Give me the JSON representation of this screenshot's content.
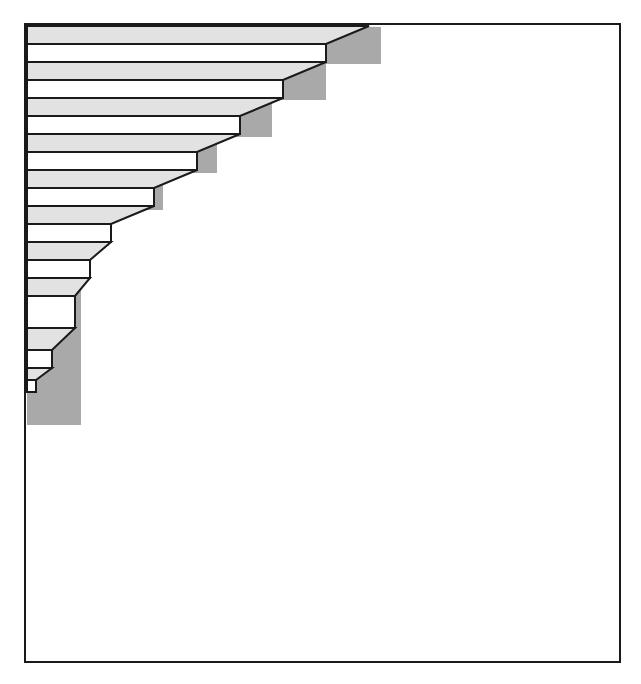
{
  "figure": {
    "type": "line-drawing",
    "background_color": "#FFFFFF"
  },
  "frame": {
    "name": "outer-border",
    "x": 25,
    "y": 24,
    "width": 595,
    "height": 638,
    "stroke_color": "#1A1A1A",
    "stroke_width": 2,
    "fill_color": "#FFFFFF"
  },
  "palette": {
    "outline": "#1A1A1A",
    "tread_light_gray": "#E2E2E2",
    "riser_white": "#FFFFFF",
    "side_wall_gray": "#A9A9A9",
    "background": "#FFFFFF"
  },
  "geometry": {
    "step_count": 10,
    "step_rise_px": 36,
    "tread_band_px": 18,
    "riser_band_px": 18,
    "run_offset_px": 43,
    "depth_dx_px": 55,
    "depth_dy_px": 18,
    "left_edge_x": 27,
    "top_edge_y": 26,
    "apex_x": 418,
    "apex_y": 27,
    "bottom_y": 425
  },
  "staircase": {
    "name": "staircase-solid",
    "side_wall_points": "27,26 418,27 381,27 381,64 326,64 326,100 272,100 272,137 217,137 217,173 163,173 163,210 109,210 109,246 81,246 81,283 81,319 81,355 81,389 81,425 27,425",
    "steps": [
      {
        "index": 1,
        "tread_points": "27,26 369,26 326,44 27,44",
        "riser_points": "27,44 326,44 326,62 27,62",
        "front_right_x": 326,
        "tread_top_y": 26,
        "tread_bottom_y": 44,
        "riser_bottom_y": 62
      },
      {
        "index": 2,
        "tread_points": "27,62 326,62 283,80 27,80",
        "riser_points": "27,80 283,80 283,98 27,98",
        "front_right_x": 283,
        "tread_top_y": 62,
        "tread_bottom_y": 80,
        "riser_bottom_y": 98
      },
      {
        "index": 3,
        "tread_points": "27,98 283,98 240,116 27,116",
        "riser_points": "27,116 240,116 240,134 27,134",
        "front_right_x": 240,
        "tread_top_y": 98,
        "tread_bottom_y": 116,
        "riser_bottom_y": 134
      },
      {
        "index": 4,
        "tread_points": "27,134 240,134 197,152 27,152",
        "riser_points": "27,152 197,152 197,170 27,170",
        "front_right_x": 197,
        "tread_top_y": 134,
        "tread_bottom_y": 152,
        "riser_bottom_y": 170
      },
      {
        "index": 5,
        "tread_points": "27,170 197,170 154,188 27,188",
        "riser_points": "27,188 154,188 154,206 27,206",
        "front_right_x": 154,
        "tread_top_y": 170,
        "tread_bottom_y": 188,
        "riser_bottom_y": 206
      },
      {
        "index": 6,
        "tread_points": "27,206 154,206 111,224 27,224",
        "riser_points": "27,224 111,224 111,242 27,242",
        "front_right_x": 111,
        "tread_top_y": 206,
        "tread_bottom_y": 224,
        "riser_bottom_y": 242
      },
      {
        "index": 7,
        "tread_points": "27,242 111,242 90,260 27,260",
        "riser_points": "27,260 90,260 90,278 27,278",
        "front_right_x": 90,
        "tread_top_y": 242,
        "tread_bottom_y": 260,
        "riser_bottom_y": 278
      },
      {
        "index": 8,
        "tread_points": "27,278 90,278 75,296 27,296",
        "riser_points": "27,296 75,296 75,328 27,328",
        "front_right_x": 75,
        "tread_top_y": 278,
        "tread_bottom_y": 296,
        "riser_bottom_y": 328
      },
      {
        "index": 9,
        "tread_points": "27,328 75,328 52,350 27,350",
        "riser_points": "27,350 52,350 52,368 27,368",
        "front_right_x": 52,
        "tread_top_y": 328,
        "tread_bottom_y": 350,
        "riser_bottom_y": 368
      },
      {
        "index": 10,
        "tread_points": "27,368 52,368 36,380 27,380",
        "riser_points": "27,380 36,380 36,392 27,392",
        "front_right_x": 36,
        "tread_top_y": 368,
        "tread_bottom_y": 380,
        "riser_bottom_y": 392
      }
    ]
  },
  "chart_data": {
    "type": "line",
    "xlabel": "Step index (top to bottom)",
    "ylabel": "Front edge x-position (px)",
    "categories": [
      "1",
      "2",
      "3",
      "4",
      "5",
      "6",
      "7",
      "8",
      "9",
      "10"
    ],
    "values": [
      326,
      283,
      240,
      197,
      154,
      111,
      90,
      75,
      52,
      36
    ],
    "series": [
      {
        "name": "tread top y",
        "values": [
          26,
          62,
          98,
          134,
          170,
          206,
          242,
          278,
          328,
          368
        ]
      },
      {
        "name": "riser bottom y",
        "values": [
          62,
          98,
          134,
          170,
          206,
          242,
          278,
          328,
          368,
          392
        ]
      }
    ],
    "xlim": [
      1,
      10
    ],
    "ylim": [
      0,
      420
    ],
    "grid": false,
    "legend": "none"
  }
}
